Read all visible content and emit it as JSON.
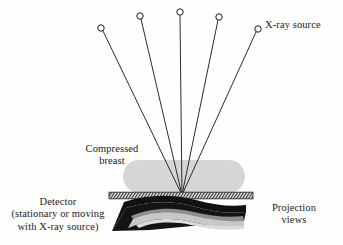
{
  "figure": {
    "type": "schematic-diagram",
    "background_color": "#fefefe",
    "ink_color": "#1b1b1b"
  },
  "labels": {
    "xray_source": "X-ray source",
    "compressed_breast_line1": "Compressed",
    "compressed_breast_line2": "breast",
    "detector_line1": "Detector",
    "detector_line2": "(stationary or moving",
    "detector_line3": "with X-ray source)",
    "projection_views_line1": "Projection",
    "projection_views_line2": "views"
  },
  "geometry": {
    "focus": {
      "x": 182,
      "y": 195
    },
    "source_positions": [
      {
        "id": 1,
        "x": 101,
        "y": 28
      },
      {
        "id": 2,
        "x": 140,
        "y": 16
      },
      {
        "id": 3,
        "x": 180,
        "y": 12
      },
      {
        "id": 4,
        "x": 219,
        "y": 17
      },
      {
        "id": 5,
        "x": 258,
        "y": 29
      }
    ],
    "source_marker": {
      "shape": "open-circle",
      "radius": 3.2,
      "fill": "#fefefe",
      "stroke": "#1b1b1b",
      "stroke_width": 1
    },
    "ray_stroke": "#2b2b2b",
    "ray_stroke_width": 1,
    "breast": {
      "shape": "stadium",
      "x": 123,
      "y": 160,
      "width": 122,
      "height": 33,
      "radius": 16.5,
      "fill": "#d6d6d6"
    },
    "detector": {
      "shape": "hatched-bar",
      "x": 109,
      "y": 192,
      "width": 144,
      "height": 7,
      "stroke": "#3a3a3a",
      "fill": "#f2f2f2",
      "hatch_angle_deg": 60,
      "hatch_spacing": 3
    },
    "projection_views": {
      "shape": "stacked-wedge",
      "dark_fill": "#111111",
      "mid_fill": "#8d8d8d",
      "light_fill": "#c7c7c7",
      "x": 112,
      "y": 201,
      "width": 134,
      "height": 30
    }
  }
}
